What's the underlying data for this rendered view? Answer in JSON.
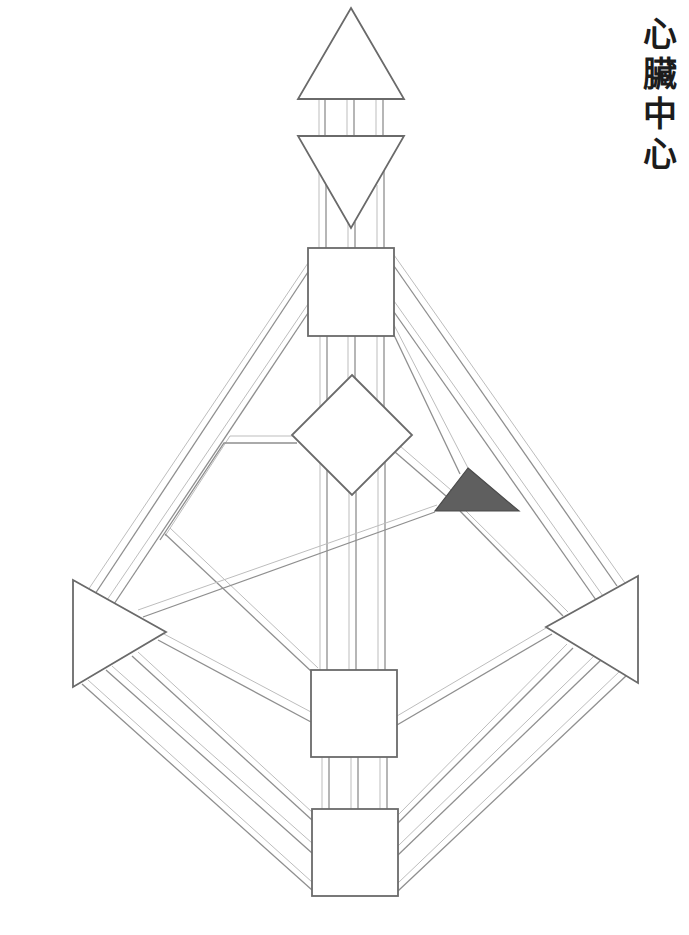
{
  "title": {
    "text": "心臟中心",
    "chars": [
      "心",
      "臟",
      "中",
      "心"
    ],
    "orientation": "vertical"
  },
  "diagram": {
    "type": "human-design-bodygraph",
    "highlighted_center": "heart",
    "colors": {
      "outline": "#6a6a6a",
      "channel_outer": "#8f8f8f",
      "channel_inner": "#bdbdbd",
      "undefined_fill": "#ffffff",
      "defined_fill": "#5f5f5f"
    },
    "centers": [
      {
        "id": "head",
        "shape": "triangle-up",
        "defined": false
      },
      {
        "id": "ajna",
        "shape": "triangle-down",
        "defined": false
      },
      {
        "id": "throat",
        "shape": "square",
        "defined": false
      },
      {
        "id": "g",
        "shape": "diamond",
        "defined": false
      },
      {
        "id": "heart",
        "shape": "triangle",
        "defined": true
      },
      {
        "id": "spleen",
        "shape": "triangle-right",
        "defined": false
      },
      {
        "id": "solar-plexus",
        "shape": "triangle-left",
        "defined": false
      },
      {
        "id": "sacral",
        "shape": "square",
        "defined": false
      },
      {
        "id": "root",
        "shape": "square",
        "defined": false
      }
    ]
  }
}
